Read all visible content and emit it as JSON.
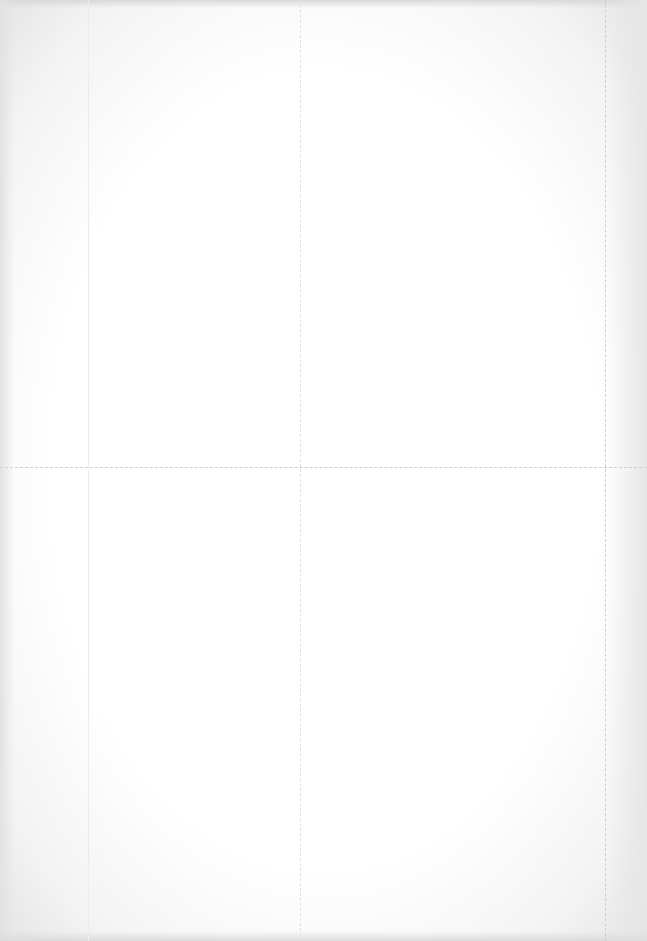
{
  "page": {
    "type": "scanned-document",
    "legible_text": false,
    "background_color": "#fdfdfd",
    "rule_color": "#cfcfcf"
  },
  "layout": {
    "vertical_rules_x": [
      88,
      300,
      605
    ],
    "horizontal_rule_y": 467
  },
  "sections": {
    "top_left": {
      "text": ""
    },
    "top_right": {
      "text": ""
    },
    "bottom_left": {
      "text": ""
    },
    "bottom_right": {
      "text": ""
    }
  }
}
